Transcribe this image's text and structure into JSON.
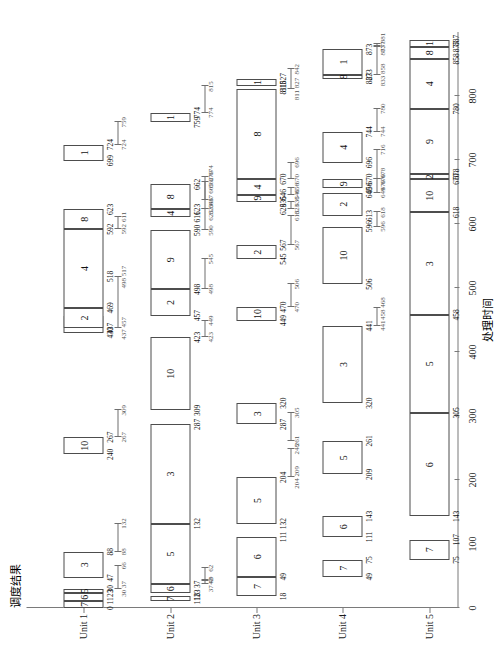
{
  "chart_data": {
    "type": "bar",
    "title": "调度结果",
    "xlabel": "处理时间",
    "ylabel": "处理单元",
    "xlim": [
      0,
      900
    ],
    "xticks": [
      0,
      100,
      200,
      300,
      400,
      500,
      600,
      700,
      800
    ],
    "xticklabels": [
      "0",
      "100",
      "200",
      "300",
      "400",
      "500",
      "600",
      "700",
      "800"
    ],
    "categories": [
      "Unit 1",
      "Unit 2",
      "Unit 3",
      "Unit 4",
      "Unit 5"
    ],
    "grid": false,
    "legend": null,
    "series": [
      {
        "name": "Unit 1",
        "tasks": [
          {
            "job": "7",
            "start": 0,
            "end": 11
          },
          {
            "job": "6",
            "start": 11,
            "end": 23
          },
          {
            "job": "5",
            "start": 23,
            "end": 30
          },
          {
            "job": "3",
            "start": 47,
            "end": 88
          },
          {
            "job": "10",
            "start": 240,
            "end": 267
          },
          {
            "job": "9",
            "start": 430,
            "end": 457
          },
          {
            "job": "2",
            "start": 437,
            "end": 469
          },
          {
            "job": "4",
            "start": 469,
            "end": 592
          },
          {
            "job": "8",
            "start": 592,
            "end": 623
          },
          {
            "job": "1",
            "start": 699,
            "end": 724
          }
        ],
        "edge_values": [
          "0",
          "11",
          "23",
          "30",
          "47",
          "88",
          "240",
          "267",
          "430",
          "437",
          "469",
          "518",
          "592",
          "623",
          "699",
          "724"
        ]
      },
      {
        "name": "Unit 2",
        "tasks": [
          {
            "job": "7",
            "start": 11,
            "end": 18
          },
          {
            "job": "6",
            "start": 23,
            "end": 37
          },
          {
            "job": "5",
            "start": 37,
            "end": 132
          },
          {
            "job": "3",
            "start": 132,
            "end": 287
          },
          {
            "job": "10",
            "start": 309,
            "end": 423
          },
          {
            "job": "2",
            "start": 457,
            "end": 498
          },
          {
            "job": "9",
            "start": 498,
            "end": 590
          },
          {
            "job": "4",
            "start": 611,
            "end": 623
          },
          {
            "job": "8",
            "start": 623,
            "end": 662
          },
          {
            "job": "1",
            "start": 759,
            "end": 774
          }
        ],
        "edge_values": [
          "11",
          "18",
          "23",
          "37",
          "132",
          "287",
          "309",
          "423",
          "457",
          "498",
          "590",
          "611",
          "623",
          "662",
          "759",
          "774"
        ]
      },
      {
        "name": "Unit 3",
        "tasks": [
          {
            "job": "7",
            "start": 18,
            "end": 49
          },
          {
            "job": "6",
            "start": 49,
            "end": 111
          },
          {
            "job": "5",
            "start": 132,
            "end": 204
          },
          {
            "job": "3",
            "start": 287,
            "end": 320
          },
          {
            "job": "10",
            "start": 449,
            "end": 470
          },
          {
            "job": "2",
            "start": 545,
            "end": 567
          },
          {
            "job": "9",
            "start": 635,
            "end": 646
          },
          {
            "job": "4",
            "start": 646,
            "end": 670
          },
          {
            "job": "8",
            "start": 670,
            "end": 811
          },
          {
            "job": "1",
            "start": 815,
            "end": 827
          }
        ],
        "edge_values": [
          "18",
          "49",
          "111",
          "132",
          "204",
          "287",
          "320",
          "449",
          "470",
          "545",
          "567",
          "623",
          "635",
          "646",
          "670",
          "811",
          "815",
          "827"
        ]
      },
      {
        "name": "Unit 4",
        "tasks": [
          {
            "job": "7",
            "start": 49,
            "end": 75
          },
          {
            "job": "6",
            "start": 111,
            "end": 143
          },
          {
            "job": "5",
            "start": 209,
            "end": 261
          },
          {
            "job": "3",
            "start": 320,
            "end": 441
          },
          {
            "job": "10",
            "start": 506,
            "end": 596
          },
          {
            "job": "2",
            "start": 613,
            "end": 649
          },
          {
            "job": "9",
            "start": 656,
            "end": 670
          },
          {
            "job": "4",
            "start": 696,
            "end": 744
          },
          {
            "job": "8",
            "start": 827,
            "end": 833
          },
          {
            "job": "1",
            "start": 833,
            "end": 873
          }
        ],
        "edge_values": [
          "49",
          "75",
          "111",
          "143",
          "209",
          "261",
          "320",
          "441",
          "506",
          "596",
          "613",
          "649",
          "656",
          "670",
          "696",
          "744",
          "827",
          "833",
          "873"
        ]
      },
      {
        "name": "Unit 5",
        "tasks": [
          {
            "job": "7",
            "start": 75,
            "end": 107
          },
          {
            "job": "6",
            "start": 143,
            "end": 305
          },
          {
            "job": "5",
            "start": 305,
            "end": 458
          },
          {
            "job": "3",
            "start": 458,
            "end": 618
          },
          {
            "job": "10",
            "start": 618,
            "end": 670
          },
          {
            "job": "2",
            "start": 670,
            "end": 678
          },
          {
            "job": "9",
            "start": 678,
            "end": 780
          },
          {
            "job": "4",
            "start": 780,
            "end": 858
          },
          {
            "job": "8",
            "start": 858,
            "end": 877
          },
          {
            "job": "1",
            "start": 877,
            "end": 887
          }
        ],
        "edge_values": [
          "75",
          "107",
          "143",
          "305",
          "458",
          "618",
          "670",
          "678",
          "780",
          "858",
          "877",
          "887"
        ]
      }
    ],
    "intervals": [
      {
        "row": 0,
        "start": 30,
        "end": 66,
        "left": "30 37",
        "right": "66"
      },
      {
        "row": 0,
        "start": 88,
        "end": 132,
        "left": "88",
        "right": "132"
      },
      {
        "row": 0,
        "start": 267,
        "end": 309,
        "left": "267",
        "right": "309"
      },
      {
        "row": 0,
        "start": 437,
        "end": 517,
        "left": "437 457",
        "right": "498 517"
      },
      {
        "row": 0,
        "start": 592,
        "end": 611,
        "left": "592",
        "right": "611"
      },
      {
        "row": 0,
        "start": 724,
        "end": 759,
        "left": "724",
        "right": "759"
      },
      {
        "row": 1,
        "start": 37,
        "end": 62,
        "left": "37 49",
        "right": "62"
      },
      {
        "row": 1,
        "start": 42,
        "end": 42,
        "left": "42",
        "right": ""
      },
      {
        "row": 1,
        "start": 423,
        "end": 449,
        "left": "423",
        "right": "449"
      },
      {
        "row": 1,
        "start": 498,
        "end": 545,
        "left": "498",
        "right": "545"
      },
      {
        "row": 1,
        "start": 590,
        "end": 623,
        "left": "590",
        "right": "623"
      },
      {
        "row": 1,
        "start": 623,
        "end": 674,
        "left": "623 646",
        "right": "662 674"
      },
      {
        "row": 1,
        "start": 637,
        "end": 665,
        "left": "637",
        "right": "665 670"
      },
      {
        "row": 1,
        "start": 774,
        "end": 815,
        "left": "774",
        "right": "815"
      },
      {
        "row": 2,
        "start": 204,
        "end": 248,
        "left": "204 209",
        "right": "248"
      },
      {
        "row": 2,
        "start": 261,
        "end": 305,
        "left": "261",
        "right": "305"
      },
      {
        "row": 2,
        "start": 470,
        "end": 506,
        "left": "470",
        "right": "506"
      },
      {
        "row": 2,
        "start": 567,
        "end": 613,
        "left": "567",
        "right": "613"
      },
      {
        "row": 2,
        "start": 623,
        "end": 635,
        "left": "623",
        "right": "635"
      },
      {
        "row": 2,
        "start": 646,
        "end": 656,
        "left": "646",
        "right": "656"
      },
      {
        "row": 2,
        "start": 670,
        "end": 696,
        "left": "670",
        "right": "696"
      },
      {
        "row": 2,
        "start": 811,
        "end": 842,
        "left": "811 827",
        "right": "842"
      },
      {
        "row": 3,
        "start": 441,
        "end": 468,
        "left": "441",
        "right": "458 468"
      },
      {
        "row": 3,
        "start": 596,
        "end": 618,
        "left": "596",
        "right": "618"
      },
      {
        "row": 3,
        "start": 649,
        "end": 670,
        "left": "649",
        "right": "670"
      },
      {
        "row": 3,
        "start": 670,
        "end": 716,
        "left": "670 678",
        "right": "716"
      },
      {
        "row": 3,
        "start": 744,
        "end": 780,
        "left": "744",
        "right": "780"
      },
      {
        "row": 3,
        "start": 833,
        "end": 881,
        "left": "833 858",
        "right": "873 881"
      },
      {
        "row": 3,
        "start": 877,
        "end": 877,
        "left": "877",
        "right": ""
      }
    ]
  }
}
